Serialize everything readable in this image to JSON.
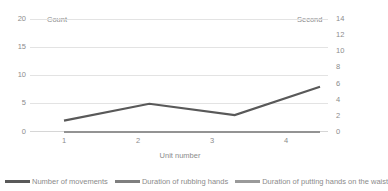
{
  "chart_data": {
    "type": "line",
    "title": "",
    "xlabel": "Unit number",
    "categories": [
      "1",
      "2",
      "3",
      "4"
    ],
    "x": [
      1,
      2,
      3,
      4
    ],
    "grid": true,
    "legend_position": "bottom",
    "axes": {
      "left": {
        "caption": "Count",
        "ticks": [
          "0",
          "5",
          "10",
          "15",
          "20"
        ],
        "ylim": [
          0,
          20
        ]
      },
      "right": {
        "caption": "Second",
        "ticks": [
          "0",
          "2",
          "4",
          "6",
          "8",
          "10",
          "12",
          "14"
        ],
        "ylim": [
          0,
          14
        ]
      }
    },
    "series": [
      {
        "name": "Number of movements",
        "axis": "left",
        "color": "#595959",
        "values": [
          2,
          5,
          3,
          8
        ]
      },
      {
        "name": "Duration of rubbing hands",
        "axis": "right",
        "color": "#7f7f7f",
        "values": [
          0,
          0,
          0,
          0
        ]
      },
      {
        "name": "Duration of putting hands on the waist",
        "axis": "right",
        "color": "#9a9a9a",
        "values": [
          0,
          0,
          0,
          0
        ]
      }
    ]
  },
  "legend": {
    "items": [
      {
        "label": "Number of movements"
      },
      {
        "label": "Duration of rubbing hands"
      },
      {
        "label": "Duration of putting hands on the waist"
      }
    ]
  },
  "left_axis": {
    "caption": "Count",
    "t0": "20",
    "t1": "15",
    "t2": "10",
    "t3": "5",
    "t4": "0"
  },
  "right_axis": {
    "caption": "Second",
    "t0": "14",
    "t1": "12",
    "t2": "10",
    "t3": "8",
    "t4": "6",
    "t5": "4",
    "t6": "2",
    "t7": "0"
  },
  "x_axis": {
    "title": "Unit number",
    "t0": "1",
    "t1": "2",
    "t2": "3",
    "t3": "4"
  }
}
